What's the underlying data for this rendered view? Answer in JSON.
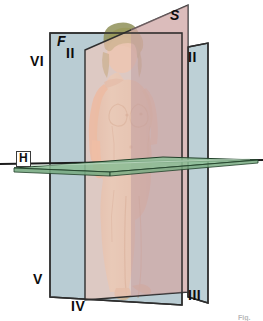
{
  "diagram": {
    "type": "anatomical-planes-3d",
    "background": "#ffffff"
  },
  "planes": [
    {
      "id": "frontal",
      "code": "F",
      "name": "Frontal plane",
      "color": "#b8cdd4",
      "opacity": 0.95,
      "orientation": "vertical",
      "label_code": "F"
    },
    {
      "id": "sagittal",
      "code": "S",
      "name": "Sagittal plane",
      "color": "#f6cdc0",
      "opacity": 0.9,
      "orientation": "vertical-depth",
      "label_code": "S"
    },
    {
      "id": "horizontal",
      "code": "H",
      "name": "Horizontal plane",
      "color": "#8fbf97",
      "opacity": 0.85,
      "orientation": "transverse",
      "label_code": "H"
    }
  ],
  "labels": {
    "frontal_code": "F",
    "sagittal_code": "S",
    "horizontal_code": "H",
    "quadrant_upper_left_outer": "VI",
    "quadrant_upper_left_inner": "II",
    "quadrant_upper_right": "II",
    "quadrant_lower_left_outer": "V",
    "quadrant_lower_left_inner": "IV",
    "quadrant_lower_right": "III",
    "corner_mark": "Fig."
  },
  "figure": {
    "skin_color": "#d8bb9c",
    "hair_color": "#8f9158",
    "arm_highlight_color": "#e8a97e",
    "transparency": "semi-transparent"
  },
  "colors": {
    "frontal_plane": "#b8cdd4",
    "sagittal_plane": "#f6cdc0",
    "overlap_mauve": "#c0a3a8",
    "horizontal_plane": "#8fbf97",
    "outline": "#2a2a2a",
    "label_text": "#0d0d0d",
    "page_background": "#ffffff"
  }
}
